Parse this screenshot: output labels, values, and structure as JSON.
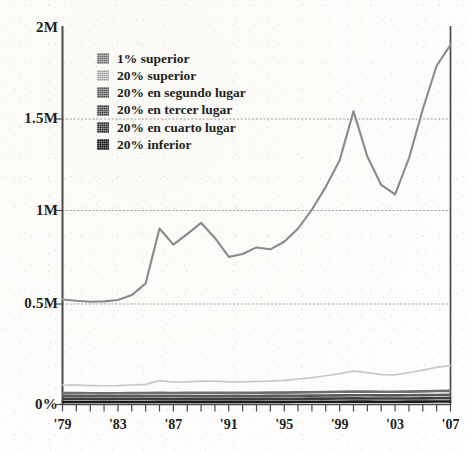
{
  "chart_data": {
    "type": "line",
    "title": "",
    "subtitle": "",
    "xlabel": "",
    "ylabel": "",
    "grid": "horizontal-dashed",
    "legend_position": "inside-top-left",
    "xlim": [
      1979,
      2007
    ],
    "ylim": [
      0,
      2000000
    ],
    "y_ticks": [
      {
        "value": 0,
        "label": "0%"
      },
      {
        "value": 500000,
        "label": "0.5M"
      },
      {
        "value": 1000000,
        "label": "1M"
      },
      {
        "value": 1500000,
        "label": "1.5M"
      },
      {
        "value": 2000000,
        "label": "2M"
      }
    ],
    "x_ticks": [
      {
        "value": 1979,
        "label": "'79"
      },
      {
        "value": 1983,
        "label": "'83"
      },
      {
        "value": 1987,
        "label": "'87"
      },
      {
        "value": 1991,
        "label": "'91"
      },
      {
        "value": 1995,
        "label": "'95"
      },
      {
        "value": 1999,
        "label": "'99"
      },
      {
        "value": 2003,
        "label": "'03"
      },
      {
        "value": 2007,
        "label": "'07"
      }
    ],
    "x": [
      1979,
      1980,
      1981,
      1982,
      1983,
      1984,
      1985,
      1986,
      1987,
      1988,
      1989,
      1990,
      1991,
      1992,
      1993,
      1994,
      1995,
      1996,
      1997,
      1998,
      1999,
      2000,
      2001,
      2002,
      2003,
      2004,
      2005,
      2006,
      2007
    ],
    "series": [
      {
        "name": "1% superior",
        "color": "#8a8a8a",
        "values": [
          555000,
          548000,
          543000,
          545000,
          552000,
          578000,
          640000,
          930000,
          845000,
          900000,
          960000,
          880000,
          780000,
          795000,
          830000,
          820000,
          860000,
          930000,
          1030000,
          1150000,
          1290000,
          1550000,
          1310000,
          1160000,
          1110000,
          1300000,
          1560000,
          1790000,
          1900000
        ]
      },
      {
        "name": "20% superior",
        "color": "#c9c9c9",
        "values": [
          103000,
          102000,
          100000,
          99000,
          100000,
          103000,
          106000,
          126000,
          118000,
          120000,
          124000,
          123000,
          120000,
          120000,
          122000,
          124000,
          128000,
          134000,
          142000,
          152000,
          163000,
          176000,
          168000,
          158000,
          157000,
          168000,
          182000,
          196000,
          206000
        ]
      },
      {
        "name": "20% en segundo lugar",
        "color": "#6e6e6e",
        "values": [
          60000,
          60000,
          59500,
          59000,
          59500,
          60000,
          60500,
          61500,
          61000,
          61500,
          62000,
          62000,
          61500,
          61500,
          62000,
          62500,
          63000,
          64000,
          65000,
          66000,
          67000,
          68500,
          68000,
          67000,
          67000,
          68000,
          69500,
          71000,
          72000
        ]
      },
      {
        "name": "20% en tercer lugar",
        "color": "#585858",
        "values": [
          44000,
          44000,
          43500,
          43200,
          43500,
          44000,
          44500,
          45000,
          44800,
          45000,
          45200,
          45200,
          45000,
          45000,
          45200,
          45500,
          46000,
          46500,
          47000,
          47500,
          48000,
          49000,
          48500,
          48000,
          48000,
          48500,
          49500,
          50500,
          51000
        ]
      },
      {
        "name": "20% en cuarto lugar",
        "color": "#3d3d3d",
        "values": [
          29000,
          29000,
          28800,
          28600,
          28800,
          29000,
          29200,
          29500,
          29400,
          29500,
          29700,
          29700,
          29500,
          29500,
          29700,
          30000,
          30200,
          30500,
          31000,
          31300,
          31600,
          32200,
          32000,
          31600,
          31600,
          32000,
          32600,
          33200,
          33600
        ]
      },
      {
        "name": "20% inferior",
        "color": "#1a1a1a",
        "values": [
          13500,
          13500,
          13400,
          13300,
          13400,
          13500,
          13600,
          13800,
          13700,
          13800,
          13900,
          13900,
          13800,
          13800,
          13900,
          14000,
          14100,
          14300,
          14500,
          14700,
          14900,
          15200,
          15100,
          14900,
          14900,
          15100,
          15400,
          15700,
          15900
        ]
      }
    ]
  },
  "legend": {
    "items": [
      {
        "label": "1% superior",
        "color": "#8a8a8a"
      },
      {
        "label": "20% superior",
        "color": "#c9c9c9"
      },
      {
        "label": "20% en segundo lugar",
        "color": "#6e6e6e"
      },
      {
        "label": "20% en tercer lugar",
        "color": "#585858"
      },
      {
        "label": "20% en cuarto lugar",
        "color": "#3d3d3d"
      },
      {
        "label": "20% inferior",
        "color": "#1a1a1a"
      }
    ]
  },
  "axes": {
    "y_tick_labels": [
      "2M",
      "1.5M",
      "1M",
      "0.5M",
      "0%"
    ],
    "x_tick_labels": [
      "'79",
      "'83",
      "'87",
      "'91",
      "'95",
      "'99",
      "'03",
      "'07"
    ]
  },
  "colors": {
    "ink": "#231f20",
    "axis": "#4a4a4a",
    "gridline": "#9a9a9a",
    "paper": "#ffffff"
  }
}
